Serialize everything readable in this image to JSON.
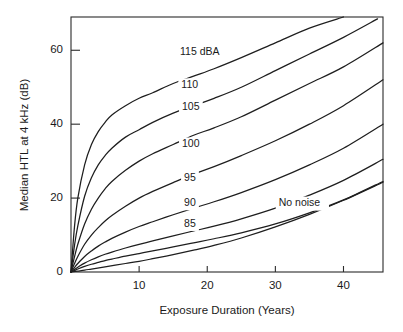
{
  "chart_data": {
    "type": "line",
    "title": "",
    "xlabel": "Exposure Duration (Years)",
    "ylabel": "Median HTL at 4 kHz (dB)",
    "xlim": [
      0,
      45.8
    ],
    "ylim": [
      0,
      69
    ],
    "xticks": [
      10,
      20,
      30,
      40
    ],
    "xticklabels": [
      "10",
      "20",
      "30",
      "40"
    ],
    "yticks": [
      0,
      20,
      40,
      60
    ],
    "yticklabels": [
      "0",
      "20",
      "40",
      "60"
    ],
    "grid": false,
    "legend_position": "inline-curve-labels",
    "line_color": "#1e1e1e",
    "series": [
      {
        "name": "115 dBA",
        "label": "115 dBA",
        "label_x": 16.0,
        "label_y": 59.5,
        "x": [
          0,
          0.5,
          1,
          2,
          3,
          4,
          5,
          6,
          8,
          10,
          12,
          15,
          18,
          21,
          25,
          30,
          35,
          40,
          42.5
        ],
        "y": [
          0,
          12,
          20,
          29,
          34.5,
          38,
          40.5,
          42.5,
          45,
          47,
          48.5,
          51,
          53,
          55,
          58,
          62,
          66,
          69,
          70
        ]
      },
      {
        "name": "110",
        "label": "110",
        "label_x": 16.2,
        "label_y": 50.5,
        "x": [
          0,
          0.5,
          1,
          2,
          3,
          4,
          5,
          6,
          8,
          10,
          12,
          15,
          18,
          21,
          25,
          30,
          35,
          40,
          45,
          45.8
        ],
        "y": [
          0,
          7,
          12.5,
          20.5,
          25.5,
          29,
          31.5,
          33.5,
          36.5,
          38.5,
          40.5,
          43,
          45,
          47,
          50,
          54.5,
          59,
          63.5,
          68.5,
          69.5
        ]
      },
      {
        "name": "105",
        "label": "105",
        "label_x": 16.3,
        "label_y": 44.5,
        "x": [
          0,
          0.5,
          1,
          2,
          3,
          4,
          5,
          6,
          8,
          10,
          12,
          15,
          18,
          21,
          25,
          30,
          35,
          40,
          45.8
        ],
        "y": [
          0,
          4,
          7.5,
          13,
          17,
          20,
          22.5,
          24.5,
          27.5,
          30,
          32,
          34.5,
          37,
          39,
          42,
          46.5,
          51,
          55.5,
          62
        ]
      },
      {
        "name": "100",
        "label": "100",
        "label_x": 16.3,
        "label_y": 34.5,
        "x": [
          0,
          0.5,
          1,
          2,
          3,
          4,
          5,
          6,
          8,
          10,
          12,
          15,
          18,
          21,
          25,
          30,
          35,
          40,
          45.8
        ],
        "y": [
          0,
          2.2,
          4.2,
          7.5,
          10,
          12,
          13.8,
          15.3,
          17.8,
          20,
          21.8,
          24.2,
          26.5,
          28.5,
          31.5,
          35.5,
          40,
          45,
          52
        ]
      },
      {
        "name": "95",
        "label": "95",
        "label_x": 16.6,
        "label_y": 25.5,
        "x": [
          0,
          0.5,
          1,
          2,
          3,
          4,
          5,
          6,
          8,
          10,
          12,
          15,
          18,
          21,
          25,
          30,
          35,
          40,
          45.8
        ],
        "y": [
          0,
          1.2,
          2.3,
          4.2,
          5.7,
          7,
          8.1,
          9.1,
          10.8,
          12.3,
          13.6,
          15.5,
          17.3,
          19,
          21.5,
          25,
          29,
          33.5,
          40
        ]
      },
      {
        "name": "90",
        "label": "90",
        "label_x": 16.6,
        "label_y": 18.6,
        "x": [
          0,
          0.5,
          1,
          2,
          3,
          4,
          5,
          6,
          8,
          10,
          12,
          15,
          18,
          21,
          25,
          30,
          35,
          40,
          45.8
        ],
        "y": [
          0,
          0.7,
          1.3,
          2.4,
          3.3,
          4.1,
          4.8,
          5.4,
          6.5,
          7.5,
          8.4,
          9.8,
          11.1,
          12.4,
          14.4,
          17.3,
          20.8,
          24.8,
          30.5
        ]
      },
      {
        "name": "85",
        "label": "85",
        "label_x": 16.6,
        "label_y": 13.0,
        "x": [
          0,
          0.5,
          1,
          2,
          3,
          4,
          5,
          6,
          8,
          10,
          12,
          15,
          18,
          21,
          25,
          30,
          35,
          40,
          45.8
        ],
        "y": [
          0,
          0.4,
          0.8,
          1.5,
          2.1,
          2.6,
          3.1,
          3.5,
          4.3,
          5,
          5.7,
          6.8,
          7.9,
          9,
          10.6,
          13,
          16,
          19.5,
          24.5
        ]
      },
      {
        "name": "No noise",
        "label": "No noise",
        "label_x": 30.5,
        "label_y": 18.5,
        "x": [
          0,
          1,
          2,
          3,
          5,
          8,
          10,
          12,
          15,
          18,
          21,
          25,
          30,
          35,
          40,
          45.8
        ],
        "y": [
          0,
          0.25,
          0.5,
          0.8,
          1.4,
          2.3,
          2.9,
          3.6,
          4.7,
          5.9,
          7.2,
          9.2,
          12.2,
          15.6,
          19.4,
          24.3
        ]
      }
    ]
  },
  "axes": {
    "x_title": "Exposure Duration (Years)",
    "y_title": "Median HTL at 4 kHz (dB)"
  }
}
